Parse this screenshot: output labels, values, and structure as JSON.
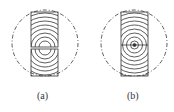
{
  "figures": [
    {
      "id": "a",
      "label": "(a)",
      "description": "split log section with grain rings, pith divided"
    },
    {
      "id": "b",
      "label": "(b)",
      "description": "log section with concentric grain rings around center pith"
    }
  ],
  "colors": {
    "line": "#333333",
    "background": "#ffffff"
  }
}
